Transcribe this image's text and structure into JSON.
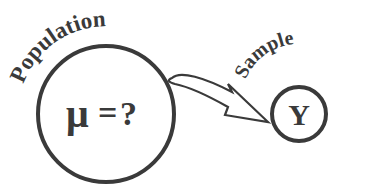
{
  "diagram": {
    "population": {
      "label": "Population",
      "symbol": "μ",
      "equals": "=",
      "question": "?"
    },
    "sample": {
      "label": "Sample",
      "symbol": "Y"
    },
    "colors": {
      "stroke": "#3a3a3a",
      "background": "#ffffff"
    }
  }
}
